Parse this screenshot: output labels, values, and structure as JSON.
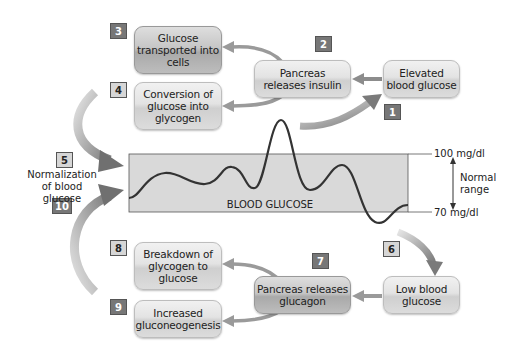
{
  "diagram": {
    "steps": [
      {
        "num": "1",
        "label": "Elevated blood glucose"
      },
      {
        "num": "2",
        "label": "Pancreas releases insulin"
      },
      {
        "num": "3",
        "label": "Glucose transported into cells"
      },
      {
        "num": "4",
        "label": "Conversion of glucose into glycogen"
      },
      {
        "num": "5",
        "label": "Normalization of blood glucose"
      },
      {
        "num": "6",
        "label": "Low blood glucose"
      },
      {
        "num": "7",
        "label": "Pancreas releases glucagon"
      },
      {
        "num": "8",
        "label": "Breakdown of glycogen to glucose"
      },
      {
        "num": "9",
        "label": "Increased gluconeogenesis"
      },
      {
        "num": "10",
        "label": "Normalization of blood glucose"
      }
    ],
    "boxes": {
      "elevated": [
        "Elevated",
        "blood glucose"
      ],
      "insulin": [
        "Pancreas",
        "releases insulin"
      ],
      "transported": [
        "Glucose",
        "transported into",
        "cells"
      ],
      "conversion": [
        "Conversion of",
        "glucose into",
        "glycogen"
      ],
      "low": [
        "Low blood",
        "glucose"
      ],
      "glucagon": [
        "Pancreas releases",
        "glucagon"
      ],
      "breakdown": [
        "Breakdown of",
        "glycogen to",
        "glucose"
      ],
      "gluconeo": [
        "Increased",
        "gluconeogenesis"
      ]
    },
    "normalization_label": [
      "Normalization",
      "of blood glucose"
    ],
    "chart": {
      "band_label": "BLOOD GLUCOSE",
      "upper_label": "100 mg/dl",
      "lower_label": "70 mg/dl",
      "range_label": [
        "Normal",
        "range"
      ]
    },
    "colors": {
      "band": "#d9d9d9",
      "curve": "#333333",
      "arrow": "#8c8c8c",
      "badge_dark": "#777777",
      "badge_light": "#d6d6d6"
    }
  }
}
